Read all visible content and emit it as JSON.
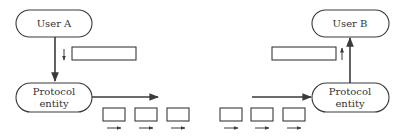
{
  "diagram": {
    "colors": {
      "stroke": "#3a3a3a",
      "background": "#ffffff",
      "text": "#333333"
    },
    "user_a": {
      "label": "User A"
    },
    "user_b": {
      "label": "User B"
    },
    "entity_a": {
      "line1": "Protocol",
      "line2": "entity"
    },
    "entity_b": {
      "line1": "Protocol",
      "line2": "entity"
    },
    "message_boxes": [
      {
        "id": "msg-a",
        "direction": "down"
      },
      {
        "id": "msg-b",
        "direction": "up"
      }
    ],
    "packets": [
      {
        "id": "pkt-1",
        "direction": "right"
      },
      {
        "id": "pkt-2",
        "direction": "right"
      },
      {
        "id": "pkt-3",
        "direction": "right"
      },
      {
        "id": "pkt-4",
        "direction": "right"
      },
      {
        "id": "pkt-5",
        "direction": "right"
      },
      {
        "id": "pkt-6",
        "direction": "right"
      }
    ]
  }
}
